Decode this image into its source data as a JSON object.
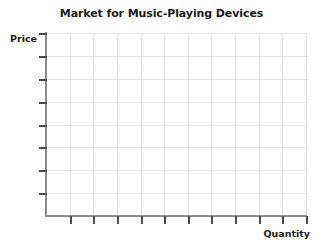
{
  "chart_data": {
    "type": "line",
    "title": "Market for Music-Playing Devices",
    "xlabel": "Quantity",
    "ylabel": "Price",
    "series": [],
    "categories": [],
    "values": [],
    "annotations": [],
    "grid": true,
    "legend": false,
    "x_tick_count": 11,
    "y_tick_count": 8,
    "x_gridline_count": 11,
    "y_gridline_count": 8,
    "x_tick_labels": [],
    "y_tick_labels": [],
    "xlim": [
      0,
      11
    ],
    "ylim": [
      0,
      8
    ],
    "note": "Empty axes template; no data plotted",
    "colors": {
      "gridline": "#e3e3e3",
      "axis": "#8d8d8d",
      "tick": "#4b4b4b",
      "text": "#1a1a1a",
      "background": "#ffffff"
    }
  }
}
